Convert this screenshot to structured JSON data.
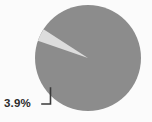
{
  "chart_data": {
    "type": "pie",
    "title": "",
    "categories": [
      "Minor share",
      "Major share"
    ],
    "values": [
      3.9,
      96.1
    ],
    "units": "percent",
    "labels": [
      {
        "text": "3.9%",
        "series_index": 0,
        "placement": "outside-left-with-leader-line"
      }
    ],
    "legend": "none",
    "grid": false,
    "colors": {
      "slice_minor": "#dddddd",
      "slice_major": "#8c8c8c",
      "leader_line": "#3a3a3a",
      "label_text": "#2b2b2b",
      "background": "#fbfbfb"
    },
    "geometry": {
      "center_x": 88,
      "center_y": 58,
      "radius": 53,
      "minor_start_angle_deg": 199,
      "minor_end_angle_deg": 213
    }
  }
}
